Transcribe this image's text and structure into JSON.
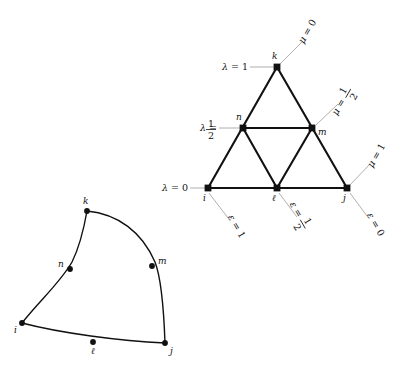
{
  "figure": {
    "title": "",
    "background_color": "#ffffff",
    "ink_color": "#111111",
    "leader_color": "#9a9a9a"
  },
  "triangle_diagram": {
    "name": "subdivided-triangle",
    "vertices": [
      {
        "id": "i",
        "label": "i",
        "x": 208,
        "y": 188,
        "marker": "square"
      },
      {
        "id": "l",
        "label": "ℓ",
        "x": 277,
        "y": 188,
        "marker": "square"
      },
      {
        "id": "j",
        "label": "j",
        "x": 347,
        "y": 188,
        "marker": "square"
      },
      {
        "id": "n",
        "label": "n",
        "x": 243,
        "y": 128,
        "marker": "square"
      },
      {
        "id": "m",
        "label": "m",
        "x": 312,
        "y": 128,
        "marker": "square"
      },
      {
        "id": "k",
        "label": "k",
        "x": 277,
        "y": 67,
        "marker": "square"
      }
    ],
    "edges": [
      {
        "from": "i",
        "to": "j"
      },
      {
        "from": "i",
        "to": "k"
      },
      {
        "from": "j",
        "to": "k"
      },
      {
        "from": "n",
        "to": "m"
      },
      {
        "from": "i",
        "to": "n"
      },
      {
        "from": "n",
        "to": "l"
      },
      {
        "from": "l",
        "to": "m"
      },
      {
        "from": "m",
        "to": "j"
      },
      {
        "from": "n",
        "to": "k"
      },
      {
        "from": "m",
        "to": "k"
      },
      {
        "from": "l",
        "to": "n"
      }
    ],
    "lambda_labels": [
      {
        "id": "lambda-1",
        "text": "λ = 1",
        "symbol": "λ",
        "value": "1",
        "fraction": false,
        "x": 222,
        "y": 67,
        "target_x": 277,
        "target_y": 67
      },
      {
        "id": "lambda-half",
        "text": "λ = 1/2",
        "symbol": "λ",
        "value": "1/2",
        "fraction": true,
        "numerator": "1",
        "denominator": "2",
        "x": 193,
        "y": 128,
        "target_x": 243,
        "target_y": 128
      },
      {
        "id": "lambda-0",
        "text": "λ = 0",
        "symbol": "λ",
        "value": "0",
        "fraction": false,
        "x": 163,
        "y": 188,
        "target_x": 208,
        "target_y": 188
      }
    ],
    "mu_labels": [
      {
        "id": "mu-0",
        "text": "μ = 0",
        "symbol": "μ",
        "value": "0",
        "fraction": false,
        "x": 312,
        "y": 30,
        "target_x": 280,
        "target_y": 64,
        "rotation": -60
      },
      {
        "id": "mu-half",
        "text": "μ = 1/2",
        "symbol": "μ",
        "value": "1/2",
        "fraction": true,
        "numerator": "1",
        "denominator": "2",
        "x": 345,
        "y": 96,
        "target_x": 316,
        "target_y": 125,
        "rotation": -60
      },
      {
        "id": "mu-1",
        "text": "μ = 1",
        "symbol": "μ",
        "value": "1",
        "fraction": false,
        "x": 376,
        "y": 155,
        "target_x": 350,
        "target_y": 185,
        "rotation": -60
      }
    ],
    "epsilon_labels": [
      {
        "id": "eps-1",
        "text": "ε = 1",
        "symbol": "ε",
        "value": "1",
        "fraction": false,
        "x": 222,
        "y": 230,
        "target_x": 209,
        "target_y": 193,
        "rotation": 60
      },
      {
        "id": "eps-half",
        "text": "ε = 1/2",
        "symbol": "ε",
        "value": "1/2",
        "fraction": true,
        "numerator": "1",
        "denominator": "2",
        "x": 291,
        "y": 230,
        "target_x": 279,
        "target_y": 193,
        "rotation": 60
      },
      {
        "id": "eps-0",
        "text": "ε = 0",
        "symbol": "ε",
        "value": "0",
        "fraction": false,
        "x": 362,
        "y": 228,
        "target_x": 350,
        "target_y": 193,
        "rotation": 60
      }
    ]
  },
  "curved_diagram": {
    "name": "curvilinear-patch",
    "vertices": [
      {
        "id": "i",
        "label": "i",
        "x": 22,
        "y": 323,
        "label_dx": -8,
        "label_dy": 10
      },
      {
        "id": "l",
        "label": "ℓ",
        "x": 93,
        "y": 342,
        "label_dx": -2,
        "label_dy": 12
      },
      {
        "id": "j",
        "label": "j",
        "x": 165,
        "y": 343,
        "label_dx": 5,
        "label_dy": 11
      },
      {
        "id": "n",
        "label": "n",
        "x": 70,
        "y": 269,
        "label_dx": -12,
        "label_dy": -2
      },
      {
        "id": "m",
        "label": "m",
        "x": 152,
        "y": 266,
        "label_dx": 6,
        "label_dy": -2
      },
      {
        "id": "k",
        "label": "k",
        "x": 87,
        "y": 211,
        "label_dx": -4,
        "label_dy": -7
      }
    ]
  }
}
